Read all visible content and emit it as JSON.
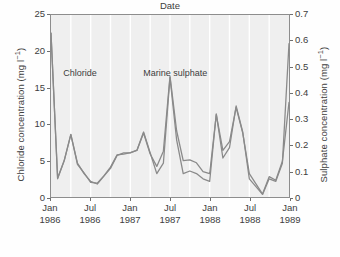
{
  "chart_data": {
    "type": "line",
    "title": "",
    "xlabel": "Date",
    "ylabel": "Chloride concentration (mg l-1)",
    "ylabel_right": "Sulphate concentration (mg l-1)",
    "ylim": [
      0,
      25
    ],
    "ylim_right": [
      0,
      0.7
    ],
    "yticks": [
      "0",
      "5",
      "10",
      "15",
      "20",
      "25"
    ],
    "yticks_right": [
      "0",
      "0.1",
      "0.2",
      "0.3",
      "0.4",
      "0.5",
      "0.6",
      "0.7"
    ],
    "xticks": [
      {
        "month": "Jan",
        "year": "1986"
      },
      {
        "month": "Jul",
        "year": "1986"
      },
      {
        "month": "Jan",
        "year": "1987"
      },
      {
        "month": "Jul",
        "year": "1987"
      },
      {
        "month": "Jan",
        "year": "1988"
      },
      {
        "month": "Jul",
        "year": "1988"
      },
      {
        "month": "Jan",
        "year": "1989"
      }
    ],
    "grid": "vertical",
    "legend_position": "inline-annotation",
    "x": [
      "1986-01",
      "1986-02",
      "1986-03",
      "1986-04",
      "1986-05",
      "1986-06",
      "1986-07",
      "1986-08",
      "1986-09",
      "1986-10",
      "1986-11",
      "1986-12",
      "1987-01",
      "1987-02",
      "1987-03",
      "1987-04",
      "1987-05",
      "1987-06",
      "1987-07",
      "1987-08",
      "1987-09",
      "1987-10",
      "1987-11",
      "1987-12",
      "1988-01",
      "1988-02",
      "1988-03",
      "1988-04",
      "1988-05",
      "1988-06",
      "1988-07",
      "1988-08",
      "1988-09",
      "1988-10",
      "1988-11",
      "1988-12",
      "1989-01"
    ],
    "series": [
      {
        "name": "Chloride",
        "axis": "left",
        "units": "mg l-1",
        "color": "#8a8a8a",
        "values": [
          22.5,
          2.6,
          5.0,
          8.6,
          4.5,
          3.3,
          2.0,
          1.9,
          2.9,
          4.1,
          5.8,
          5.9,
          6.1,
          6.4,
          8.8,
          5.9,
          4.2,
          6.3,
          16.6,
          9.1,
          5.0,
          5.1,
          4.7,
          3.5,
          3.2,
          11.3,
          6.4,
          7.6,
          12.3,
          8.8,
          3.2,
          1.8,
          0.4,
          2.8,
          2.3,
          4.9,
          13.0
        ]
      },
      {
        "name": "Marine sulphate",
        "axis": "right",
        "units": "mg l-1",
        "color": "#8a8a8a",
        "values": [
          0.63,
          0.07,
          0.14,
          0.24,
          0.13,
          0.09,
          0.06,
          0.05,
          0.08,
          0.11,
          0.16,
          0.17,
          0.17,
          0.18,
          0.25,
          0.17,
          0.09,
          0.13,
          0.46,
          0.22,
          0.09,
          0.1,
          0.09,
          0.07,
          0.06,
          0.32,
          0.15,
          0.19,
          0.35,
          0.25,
          0.07,
          0.04,
          0.01,
          0.07,
          0.06,
          0.13,
          0.59
        ]
      }
    ],
    "annotations": [
      {
        "text": "Chloride",
        "x": "1986-03",
        "y": 16.8
      },
      {
        "text": "Marine sulphate",
        "x": "1987-03",
        "y": 16.8
      }
    ]
  }
}
